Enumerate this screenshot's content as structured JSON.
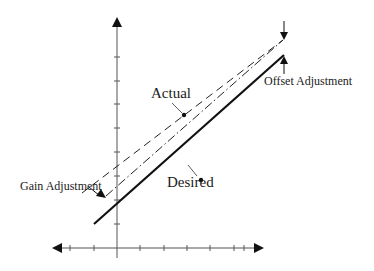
{
  "diagram": {
    "title": "",
    "labels": {
      "actual": "Actual",
      "desired": "Desired",
      "offset_adjustment": "Offset Adjustment",
      "gain_adjustment": "Gain Adjustment"
    },
    "axes": {
      "x_axis": "bidirectional arrow",
      "y_axis": "upward arrow",
      "x_ticks_count": 9,
      "y_ticks_count": 8
    },
    "lines": [
      {
        "name": "desired",
        "style": "solid-thick"
      },
      {
        "name": "actual",
        "style": "dashed"
      },
      {
        "name": "gain-adjusted",
        "style": "dash-dot"
      }
    ],
    "colors": {
      "ink": "#1a1a1a",
      "axis": "#555555",
      "background": "#ffffff"
    }
  }
}
